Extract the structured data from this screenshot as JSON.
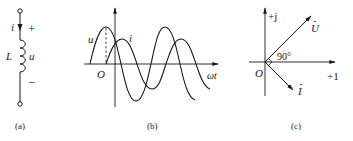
{
  "panels": {
    "a": {
      "caption": "(a)",
      "current_label": "i",
      "inductor_label": "L",
      "voltage_label": "u",
      "plus": "+",
      "minus": "−"
    },
    "b": {
      "caption": "(b)",
      "voltage_label": "u",
      "current_label": "i",
      "origin_label": "O",
      "x_axis_label": "ωt"
    },
    "c": {
      "caption": "(c)",
      "imag_axis_label": "+j",
      "real_axis_label": "+1",
      "origin_label": "O",
      "voltage_phasor_label": "U",
      "current_phasor_label": "I",
      "angle_label": "90°"
    }
  },
  "colors": {
    "ink": "#1a1a1a",
    "background": "#ffffff"
  }
}
